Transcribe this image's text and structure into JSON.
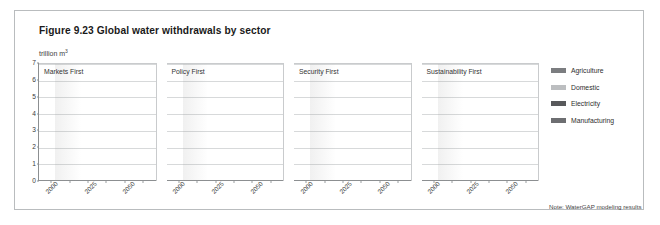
{
  "figure": {
    "title": "Figure 9.23 Global water withdrawals by sector",
    "unit_label": "trillion m",
    "unit_sup": "3",
    "note": "Note: WaterGAP modeling results"
  },
  "legend": {
    "position": "right",
    "items": [
      {
        "label": "Agriculture",
        "color": "#7b7d80"
      },
      {
        "label": "Domestic",
        "color": "#bcbec0"
      },
      {
        "label": "Electricity",
        "color": "#58595b"
      },
      {
        "label": "Manufacturing",
        "color": "#6d6e71"
      }
    ]
  },
  "chart_data": {
    "type": "bar",
    "subtype": "stacked",
    "title": "Figure 9.23 Global water withdrawals by sector",
    "subtitle": "trillion m3",
    "xlabel": "",
    "ylabel": "trillion m3",
    "ylim": [
      0,
      7
    ],
    "yticks": [
      0,
      1,
      2,
      3,
      4,
      5,
      6,
      7
    ],
    "grid": true,
    "legend_entries": [
      "Agriculture",
      "Domestic",
      "Electricity",
      "Manufacturing"
    ],
    "annotations": [
      "Note: WaterGAP modeling results"
    ],
    "x": [
      "2000",
      "2010",
      "2025",
      "2035",
      "2050",
      "2060"
    ],
    "tick_labels": [
      "2000",
      "",
      "2025",
      "",
      "2050",
      ""
    ],
    "panels": [
      {
        "name": "Markets First",
        "totals": [
          3.8,
          4.05,
          4.4,
          4.8,
          5.6,
          6.1
        ],
        "series": [
          {
            "name": "Manufacturing",
            "values": [
              0.42,
              0.5,
              0.62,
              0.75,
              0.92,
              1.05
            ]
          },
          {
            "name": "Electricity",
            "values": [
              0.3,
              0.36,
              0.48,
              0.62,
              0.95,
              1.1
            ]
          },
          {
            "name": "Domestic",
            "values": [
              0.28,
              0.34,
              0.42,
              0.48,
              0.62,
              0.7
            ]
          },
          {
            "name": "Agriculture",
            "values": [
              2.8,
              2.85,
              2.88,
              2.95,
              3.11,
              3.25
            ]
          }
        ]
      },
      {
        "name": "Policy First",
        "totals": [
          3.8,
          3.75,
          3.8,
          3.9,
          4.0,
          3.7
        ],
        "series": [
          {
            "name": "Manufacturing",
            "values": [
              0.42,
              0.45,
              0.48,
              0.52,
              0.56,
              0.5
            ]
          },
          {
            "name": "Electricity",
            "values": [
              0.3,
              0.32,
              0.36,
              0.4,
              0.45,
              0.4
            ]
          },
          {
            "name": "Domestic",
            "values": [
              0.28,
              0.3,
              0.33,
              0.36,
              0.4,
              0.36
            ]
          },
          {
            "name": "Agriculture",
            "values": [
              2.8,
              2.68,
              2.63,
              2.62,
              2.59,
              2.44
            ]
          }
        ]
      },
      {
        "name": "Security First",
        "totals": [
          3.85,
          4.5,
          5.25,
          6.0,
          6.5,
          7.05
        ],
        "series": [
          {
            "name": "Manufacturing",
            "values": [
              0.42,
              0.55,
              0.72,
              0.9,
              1.05,
              1.2
            ]
          },
          {
            "name": "Electricity",
            "values": [
              0.3,
              0.42,
              0.6,
              0.8,
              0.95,
              1.15
            ]
          },
          {
            "name": "Domestic",
            "values": [
              0.28,
              0.38,
              0.5,
              0.62,
              0.75,
              0.9
            ]
          },
          {
            "name": "Agriculture",
            "values": [
              2.85,
              3.15,
              3.43,
              3.68,
              3.75,
              3.8
            ]
          }
        ]
      },
      {
        "name": "Sustainability First",
        "totals": [
          3.9,
          4.05,
          4.3,
          4.45,
          4.4,
          4.25
        ],
        "series": [
          {
            "name": "Manufacturing",
            "values": [
              0.42,
              0.48,
              0.55,
              0.58,
              0.56,
              0.52
            ]
          },
          {
            "name": "Electricity",
            "values": [
              0.3,
              0.35,
              0.42,
              0.45,
              0.44,
              0.41
            ]
          },
          {
            "name": "Domestic",
            "values": [
              0.28,
              0.32,
              0.38,
              0.42,
              0.42,
              0.4
            ]
          },
          {
            "name": "Agriculture",
            "values": [
              2.9,
              2.9,
              2.95,
              3.0,
              2.98,
              2.92
            ]
          }
        ]
      }
    ]
  }
}
